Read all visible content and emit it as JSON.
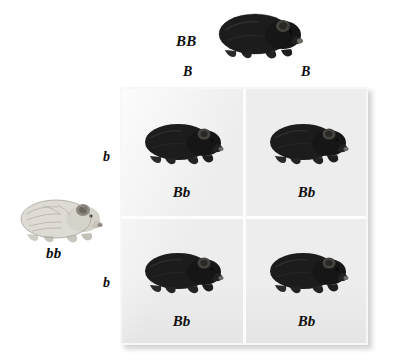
{
  "diagram": {
    "type": "punnett-square",
    "cross": "BB x bb",
    "grid_background": "#ededed",
    "parents": {
      "top": {
        "genotype": "BB",
        "phenotype": "black",
        "coat_color": "#1a1a1a",
        "gametes": [
          "B",
          "B"
        ]
      },
      "left": {
        "genotype": "bb",
        "phenotype": "white",
        "coat_color": "#d8d6d0",
        "gametes": [
          "b",
          "b"
        ]
      }
    },
    "column_headers": [
      "B",
      "B"
    ],
    "row_headers": [
      "b",
      "b"
    ],
    "offspring": [
      [
        {
          "genotype": "Bb",
          "phenotype": "black",
          "coat_color": "#1a1a1a"
        },
        {
          "genotype": "Bb",
          "phenotype": "black",
          "coat_color": "#1a1a1a"
        }
      ],
      [
        {
          "genotype": "Bb",
          "phenotype": "black",
          "coat_color": "#1a1a1a"
        },
        {
          "genotype": "Bb",
          "phenotype": "black",
          "coat_color": "#1a1a1a"
        }
      ]
    ]
  }
}
